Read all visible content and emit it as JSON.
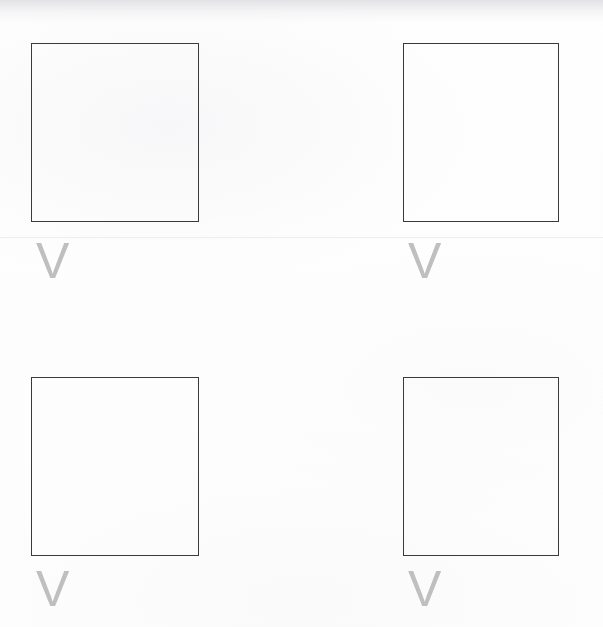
{
  "page": {
    "width": 603,
    "height": 627,
    "background_color": "#fdfdfd"
  },
  "style": {
    "square_border_color": "#3a3a3a",
    "square_border_width": 1,
    "mark_color": "#bfbfbf",
    "divider_color": "#eeeef0"
  },
  "divider": {
    "y": 237
  },
  "grid": {
    "rows": 2,
    "columns": 2,
    "cells": [
      {
        "id": "cell-top-left",
        "row": 0,
        "column": 0,
        "square": {
          "x": 31,
          "y": 43,
          "width": 168,
          "height": 179
        },
        "mark": {
          "text": "V",
          "x": 36,
          "y": 236,
          "font_size": 50,
          "color": "#bfbfbf",
          "icon_name": "v-mark-icon"
        }
      },
      {
        "id": "cell-top-right",
        "row": 0,
        "column": 1,
        "square": {
          "x": 403,
          "y": 43,
          "width": 156,
          "height": 179
        },
        "mark": {
          "text": "V",
          "x": 408,
          "y": 236,
          "font_size": 50,
          "color": "#bfbfbf",
          "icon_name": "v-mark-icon"
        }
      },
      {
        "id": "cell-bottom-left",
        "row": 1,
        "column": 0,
        "square": {
          "x": 31,
          "y": 377,
          "width": 168,
          "height": 179
        },
        "mark": {
          "text": "V",
          "x": 36,
          "y": 564,
          "font_size": 50,
          "color": "#bfbfbf",
          "icon_name": "v-mark-icon"
        }
      },
      {
        "id": "cell-bottom-right",
        "row": 1,
        "column": 1,
        "square": {
          "x": 403,
          "y": 377,
          "width": 156,
          "height": 179
        },
        "mark": {
          "text": "V",
          "x": 408,
          "y": 564,
          "font_size": 50,
          "color": "#bfbfbf",
          "icon_name": "v-mark-icon"
        }
      }
    ]
  }
}
